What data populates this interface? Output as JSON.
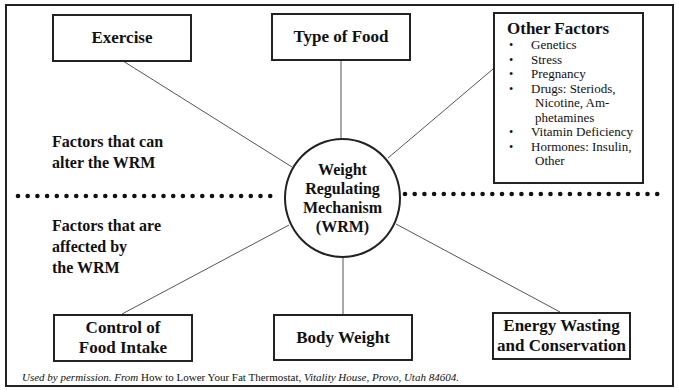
{
  "diagram": {
    "hub": {
      "lines": [
        "Weight",
        "Regulating",
        "Mechanism",
        "(WRM)"
      ]
    },
    "section_labels": {
      "upper": [
        "Factors that can",
        "alter the WRM"
      ],
      "lower": [
        "Factors that are",
        "affected by",
        "the WRM"
      ]
    },
    "input_boxes": [
      {
        "id": "exercise",
        "lines": [
          "Exercise"
        ]
      },
      {
        "id": "type-of-food",
        "lines": [
          "Type of Food"
        ]
      }
    ],
    "other_factors": {
      "title": "Other Factors",
      "bullet": "•",
      "items": [
        {
          "text": "Genetics"
        },
        {
          "text": "Stress"
        },
        {
          "text": "Pregnancy"
        },
        {
          "text": "Drugs:  Steriods,",
          "continuation": [
            "Nicotine, Am-",
            "phetamines"
          ]
        },
        {
          "text": "Vitamin Deficiency"
        },
        {
          "text": "Hormones: Insulin,",
          "continuation": [
            "Other"
          ]
        }
      ]
    },
    "output_boxes": [
      {
        "id": "control-of-food-intake",
        "lines": [
          "Control of",
          "Food Intake"
        ]
      },
      {
        "id": "body-weight",
        "lines": [
          "Body Weight"
        ]
      },
      {
        "id": "energy-wasting",
        "lines": [
          "Energy Wasting",
          "and Conservation"
        ]
      }
    ],
    "divider": {
      "style": "dotted",
      "color": "#111111"
    }
  },
  "footer": {
    "part1": "Used by permission.  From ",
    "part2": "How to Lower Your Fat Thermostat, ",
    "part3": "Vitality House, Provo, Utah  84604."
  },
  "colors": {
    "line": "#222222",
    "connector": "#555555",
    "background": "#ffffff"
  }
}
